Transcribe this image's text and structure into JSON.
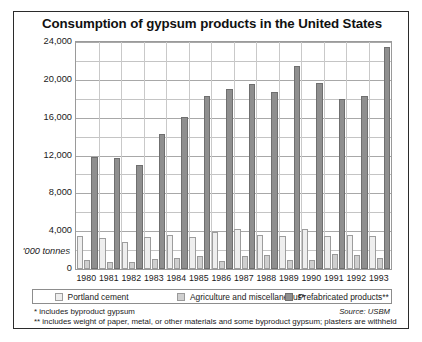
{
  "chart_data": {
    "type": "bar",
    "title": "Consumption of gypsum products in the United States",
    "xlabel": "",
    "ylabel": "'000 tonnes",
    "ylim": [
      0,
      24000
    ],
    "ytick_labels": [
      "24,000",
      "20,000",
      "16,000",
      "12,000",
      "8,000",
      "4,000",
      "0"
    ],
    "ytick_values": [
      24000,
      20000,
      16000,
      12000,
      8000,
      4000,
      0
    ],
    "gridline_values": [
      24000,
      22000,
      20000,
      18000,
      16000,
      14000,
      12000,
      10000,
      8000,
      6000,
      4000,
      2000,
      0
    ],
    "grid": true,
    "legend_position": "bottom",
    "categories": [
      "1980",
      "1981",
      "1982",
      "1983",
      "1984",
      "1985",
      "1986",
      "1987",
      "1988",
      "1989",
      "1990",
      "1991",
      "1992",
      "1993"
    ],
    "series": [
      {
        "name": "Portland cement",
        "color": "#eeeeee",
        "values": [
          3500,
          3250,
          2900,
          3400,
          3550,
          3400,
          3900,
          4250,
          3550,
          3500,
          4200,
          3450,
          3600,
          3500
        ]
      },
      {
        "name": "Agriculture and miscellaneous*",
        "color": "#cfcfcf",
        "values": [
          950,
          750,
          700,
          1050,
          1150,
          1400,
          900,
          1400,
          1500,
          1000,
          950,
          1600,
          1450,
          1200
        ]
      },
      {
        "name": "Prefabricated products**",
        "color": "#8f8f8f",
        "values": [
          11800,
          11700,
          11000,
          14250,
          16100,
          18300,
          19000,
          19600,
          18700,
          21500,
          19700,
          18000,
          18300,
          23500
        ]
      }
    ],
    "footnotes": [
      "* includes byproduct gypsum",
      "** includes weight of paper, metal, or other materials and some byproduct gypsum; plasters are withheld"
    ],
    "source": "Source: USBM"
  }
}
